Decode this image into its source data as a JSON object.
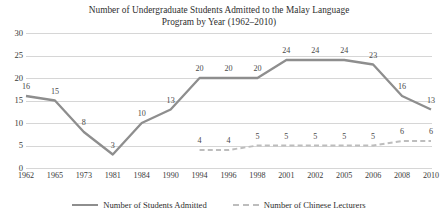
{
  "chart_data": {
    "type": "line",
    "title": "Number of Undergraduate Students Admitted to the Malay Language Program by Year (1962–2010)",
    "title_lines": [
      "Number of Undergraduate Students Admitted to the Malay Language",
      "Program by Year (1962–2010)"
    ],
    "xlabel": "",
    "ylabel": "",
    "categories": [
      "1962",
      "1965",
      "1973",
      "1981",
      "1984",
      "1990",
      "1994",
      "1996",
      "1998",
      "2001",
      "2002",
      "2005",
      "2006",
      "2008",
      "2010"
    ],
    "ylim": [
      0,
      30
    ],
    "yticks": [
      "0",
      "5",
      "10",
      "15",
      "20",
      "25",
      "30"
    ],
    "grid": true,
    "legend_position": "bottom",
    "series": [
      {
        "name": "Number of Students Admitted",
        "style": "solid",
        "color": "#8e8e8e",
        "values": [
          16,
          15,
          8,
          3,
          10,
          13,
          20,
          20,
          20,
          24,
          24,
          24,
          23,
          16,
          13
        ],
        "labels": [
          "16",
          "15",
          "8",
          "3",
          "10",
          "13",
          "20",
          "20",
          "20",
          "24",
          "24",
          "24",
          "23",
          "16",
          "13"
        ]
      },
      {
        "name": "Number of Chinese Lecturers",
        "style": "dashed",
        "color": "#bdbdbd",
        "start_index": 6,
        "values": [
          null,
          null,
          null,
          null,
          null,
          null,
          4,
          4,
          5,
          5,
          5,
          5,
          5,
          6,
          6
        ],
        "labels": [
          "",
          "",
          "",
          "",
          "",
          "",
          "4",
          "4",
          "5",
          "5",
          "5",
          "5",
          "5",
          "6",
          "6"
        ]
      }
    ]
  },
  "legend": {
    "entries": [
      {
        "label": "Number of Students Admitted"
      },
      {
        "label": "Number of Chinese Lecturers"
      }
    ]
  }
}
